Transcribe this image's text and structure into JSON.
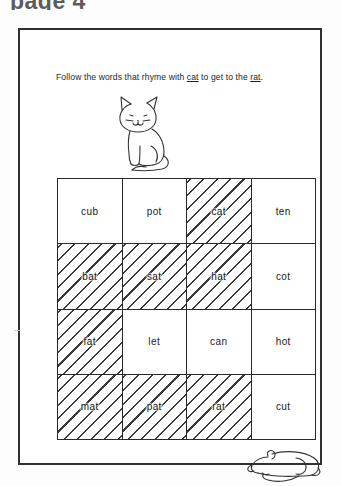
{
  "page": {
    "header_text": "page 4",
    "background_color": "#fdfdfd",
    "ink_color": "#2a2a2a"
  },
  "instruction": {
    "prefix": "Follow the words that rhyme with ",
    "rhyme_key": "cat",
    "middle": " to get to the ",
    "goal_word": "rat",
    "suffix": ".",
    "full_text": "Follow the words that rhyme with cat to get to the rat."
  },
  "illustrations": {
    "cat": {
      "name": "cat-drawing",
      "description": "line drawing of a sitting cat"
    },
    "rat": {
      "name": "rat-drawing",
      "description": "line drawing of a reclining rat with long tail"
    }
  },
  "maze": {
    "rows": 4,
    "columns": 4,
    "hatch_meaning": "shaded path word rhyming with cat",
    "cells": [
      [
        {
          "word": "cub",
          "hatched": false
        },
        {
          "word": "pot",
          "hatched": false
        },
        {
          "word": "cat",
          "hatched": true
        },
        {
          "word": "ten",
          "hatched": false
        }
      ],
      [
        {
          "word": "bat",
          "hatched": true
        },
        {
          "word": "sat",
          "hatched": true
        },
        {
          "word": "hat",
          "hatched": true
        },
        {
          "word": "cot",
          "hatched": false
        }
      ],
      [
        {
          "word": "fat",
          "hatched": true
        },
        {
          "word": "let",
          "hatched": false
        },
        {
          "word": "can",
          "hatched": false
        },
        {
          "word": "hot",
          "hatched": false
        }
      ],
      [
        {
          "word": "mat",
          "hatched": true
        },
        {
          "word": "pat",
          "hatched": true
        },
        {
          "word": "rat",
          "hatched": true
        },
        {
          "word": "cut",
          "hatched": false
        }
      ]
    ]
  }
}
